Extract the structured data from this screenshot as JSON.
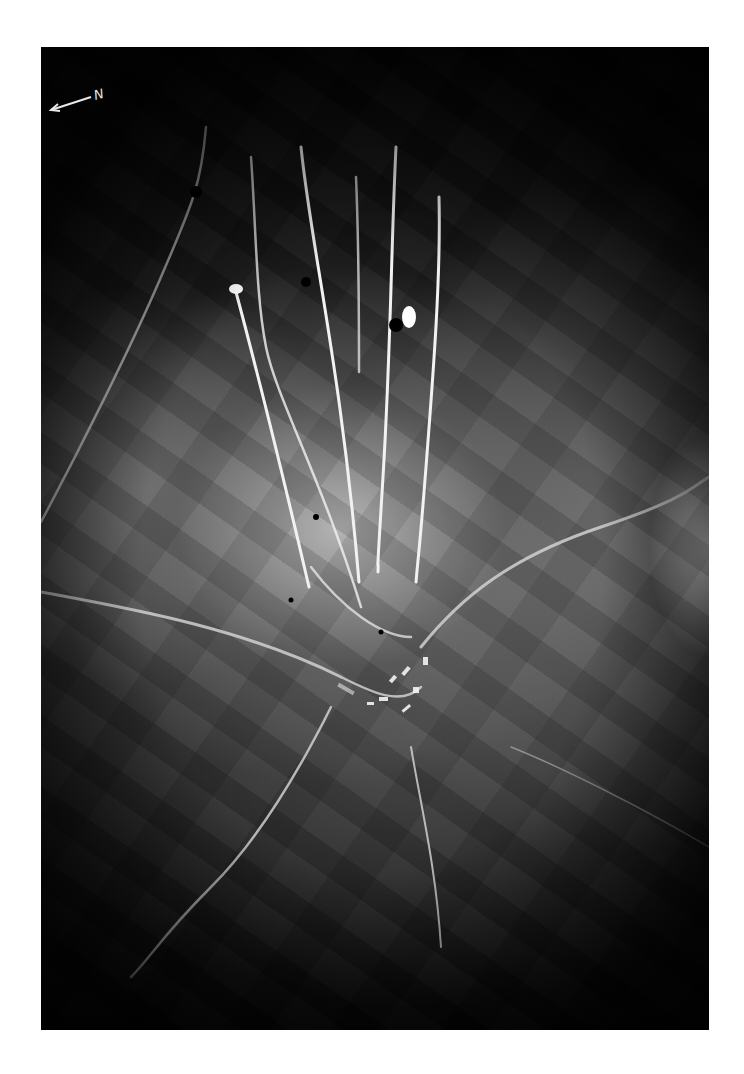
{
  "photo": {
    "description": "Aerial night reconnaissance photograph of a village with road junction and vertical light trails",
    "north_marker": {
      "label": "N",
      "icon": "north-arrow-icon"
    },
    "colors": {
      "background": "#ffffff",
      "photo_dark": "#050505",
      "highlight": "#f2f2f2"
    }
  }
}
